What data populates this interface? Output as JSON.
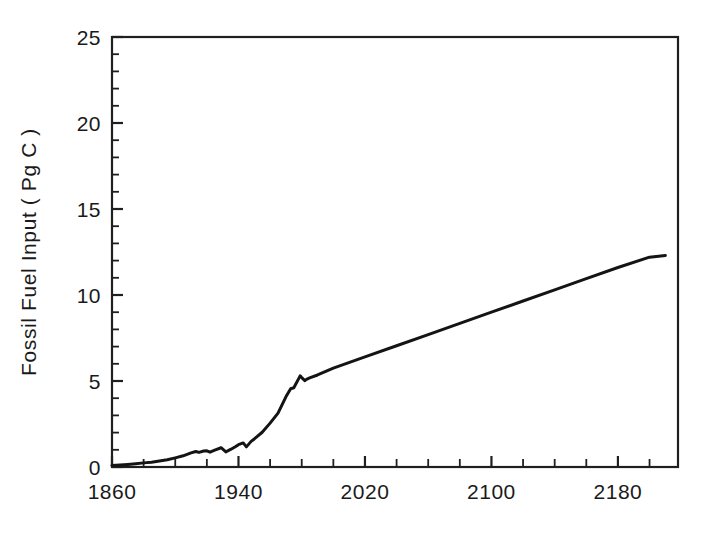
{
  "figure": {
    "background_color": "#ffffff",
    "line_color": "#141414",
    "axis_color": "#1f1f1f"
  },
  "chart_data": {
    "type": "line",
    "title": "",
    "xlabel": "",
    "ylabel": "Fossil Fuel Input ( Pg C )",
    "xlim": [
      1860,
      2218
    ],
    "ylim": [
      0,
      25
    ],
    "grid": false,
    "legend": null,
    "x_major_ticks": [
      1860,
      1940,
      2020,
      2100,
      2180
    ],
    "x_major_tick_labels": [
      "1860",
      "1940",
      "2020",
      "2100",
      "2180"
    ],
    "x_minor_tick_interval": 20,
    "y_major_ticks": [
      0,
      5,
      10,
      15,
      20,
      25
    ],
    "y_major_tick_labels": [
      "0",
      "5",
      "10",
      "15",
      "20",
      "25"
    ],
    "y_minor_tick_interval": 1,
    "axes_spines": [
      "left",
      "top",
      "right",
      "bottom"
    ],
    "series": [
      {
        "name": "Fossil Fuel Input",
        "units": "Pg C",
        "x": [
          1860,
          1865,
          1870,
          1875,
          1880,
          1885,
          1890,
          1895,
          1900,
          1905,
          1910,
          1913,
          1915,
          1918,
          1920,
          1922,
          1925,
          1929,
          1932,
          1935,
          1938,
          1940,
          1943,
          1945,
          1948,
          1950,
          1955,
          1960,
          1965,
          1970,
          1973,
          1975,
          1979,
          1980,
          1982,
          1983,
          1985,
          1990,
          2000,
          2020,
          2040,
          2060,
          2080,
          2100,
          2120,
          2140,
          2160,
          2180,
          2200,
          2210
        ],
        "y": [
          0.09,
          0.12,
          0.15,
          0.19,
          0.24,
          0.28,
          0.35,
          0.42,
          0.53,
          0.65,
          0.82,
          0.9,
          0.85,
          0.93,
          0.94,
          0.86,
          0.98,
          1.12,
          0.88,
          1.02,
          1.18,
          1.3,
          1.4,
          1.17,
          1.49,
          1.63,
          2.02,
          2.55,
          3.13,
          4.08,
          4.55,
          4.61,
          5.3,
          5.2,
          5.02,
          5.1,
          5.18,
          5.35,
          5.75,
          6.4,
          7.05,
          7.7,
          8.35,
          9.0,
          9.65,
          10.3,
          10.95,
          11.6,
          12.2,
          12.3
        ]
      }
    ],
    "annotations": [
      {
        "text": "historical emissions rise with dips near 1915, 1932, 1945 and 1979-1983",
        "kind": "description"
      },
      {
        "text": "linear projection from about 1985 onward reaching roughly 12.3 Pg C",
        "kind": "description"
      }
    ]
  }
}
